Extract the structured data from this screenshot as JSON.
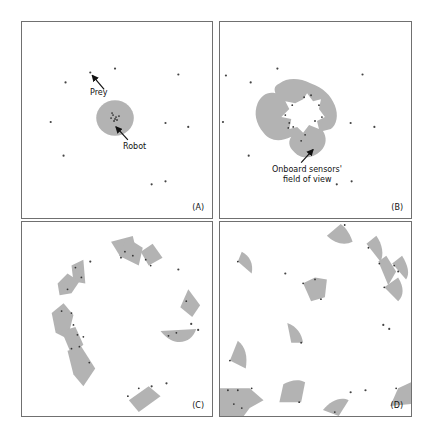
{
  "figure": {
    "panels": [
      {
        "id": "A",
        "label": "(A)",
        "annotations": [
          {
            "text": "Prey",
            "x": 78,
            "y": 66
          },
          {
            "text": "Robot",
            "x": 102,
            "y": 120
          }
        ]
      },
      {
        "id": "B",
        "label": "(B)",
        "annotations": [
          {
            "text": "Onboard sensors'",
            "x": 120,
            "y": 143
          },
          {
            "text": "field of view",
            "x": 120,
            "y": 153
          }
        ]
      },
      {
        "id": "C",
        "label": "(C)",
        "annotations": []
      },
      {
        "id": "D",
        "label": "(D)",
        "annotations": []
      }
    ],
    "colors": {
      "field_of_view": "#b3b3b3",
      "agent_dot": "#444444",
      "panel_border": "#707070"
    }
  }
}
